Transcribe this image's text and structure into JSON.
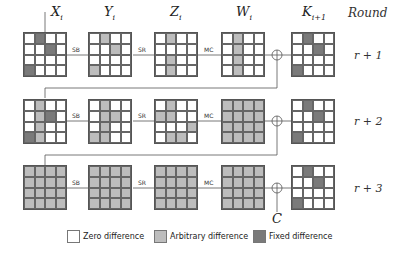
{
  "header": {
    "columns": [
      "X",
      "Y",
      "Z",
      "W",
      "K"
    ],
    "column_subscripts": [
      "i",
      "i",
      "i",
      "i",
      "i+1"
    ],
    "round_header": "Round"
  },
  "operations": [
    "SB",
    "SR",
    "MC"
  ],
  "rounds": [
    {
      "label": "r + 1",
      "states": [
        [
          "0100",
          "0010",
          "0000",
          "1000"
        ],
        [
          "0100",
          "0010",
          "0000",
          "1000"
        ],
        [
          "0100",
          "0000",
          "0100",
          "0100"
        ],
        [
          "0100",
          "0100",
          "0100",
          "0100"
        ],
        [
          "0100",
          "0010",
          "0000",
          "1000"
        ]
      ],
      "kinds": [
        "f",
        "a",
        "a",
        "a",
        "f"
      ]
    },
    {
      "label": "r + 2",
      "states": [
        [
          "0100",
          "0120",
          "0100",
          "2100"
        ],
        [
          "0100",
          "0110",
          "0100",
          "1100"
        ],
        [
          "0100",
          "1100",
          "0001",
          "0110"
        ],
        [
          "1111",
          "1111",
          "1111",
          "1111"
        ],
        [
          "0100",
          "0010",
          "0000",
          "1000"
        ]
      ],
      "kinds": [
        "mix",
        "a",
        "a",
        "a",
        "f"
      ]
    },
    {
      "label": "r + 3",
      "states": [
        [
          "1111",
          "1111",
          "1111",
          "1111"
        ],
        [
          "1111",
          "1111",
          "1111",
          "1111"
        ],
        [
          "1111",
          "1111",
          "1111",
          "1111"
        ],
        [
          "1111",
          "1111",
          "1111",
          "1111"
        ],
        [
          "0100",
          "0010",
          "0000",
          "1000"
        ]
      ],
      "kinds": [
        "a",
        "a",
        "a",
        "a",
        "f"
      ]
    }
  ],
  "output_label": "C",
  "legend": [
    {
      "label": "Zero difference",
      "color": "#ffffff"
    },
    {
      "label": "Arbitrary difference",
      "color": "#bdbdbd"
    },
    {
      "label": "Fixed difference",
      "color": "#7a7a7a"
    }
  ]
}
